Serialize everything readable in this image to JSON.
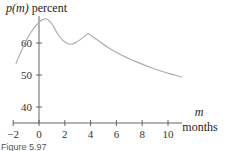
{
  "chart_data": {
    "type": "line",
    "title": "",
    "xlabel": "m months",
    "ylabel": "p(m) percent",
    "xlabel_var": "m",
    "xlabel_unit": "months",
    "ylabel_var": "p(m)",
    "ylabel_unit": "percent",
    "xlim": [
      -2,
      11.2
    ],
    "ylim": [
      35,
      68
    ],
    "x_ticks": [
      -2,
      0,
      2,
      4,
      6,
      8,
      10
    ],
    "y_ticks": [
      40,
      50,
      60
    ],
    "grid": false,
    "legend": null,
    "series": [
      {
        "name": "p(m)",
        "color": "#aaaaaa",
        "x": [
          -1.8,
          -1.2,
          -0.6,
          0,
          0.3,
          0.6,
          1.0,
          1.5,
          2.0,
          2.5,
          3.0,
          3.5,
          3.8,
          4.5,
          5.5,
          6.5,
          7.5,
          8.5,
          9.5,
          10.5,
          11.1
        ],
        "y": [
          53.5,
          59.0,
          63.5,
          66.5,
          67.3,
          67.5,
          66.0,
          62.5,
          60.3,
          59.6,
          60.5,
          62.0,
          63.0,
          61.0,
          58.2,
          56.0,
          54.2,
          52.6,
          51.2,
          50.0,
          49.3
        ]
      }
    ]
  },
  "labels": {
    "y_axis_title_var": "p(m)",
    "y_axis_title_unit": " percent",
    "x_axis_title_var": "m",
    "x_axis_title_unit": "months",
    "caption": "Figure 5.97"
  }
}
